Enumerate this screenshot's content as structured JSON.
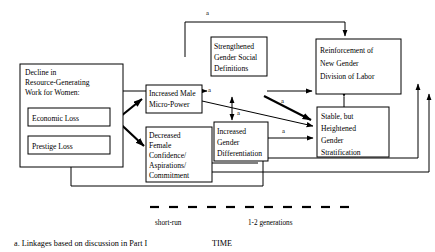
{
  "figure": {
    "type": "flow-diagram",
    "boxes": [
      {
        "id": "decline",
        "lines": [
          "Decline in",
          "Resource-Generating",
          "Work for Women:"
        ]
      },
      {
        "id": "economic-loss",
        "lines": [
          "Economic Loss"
        ]
      },
      {
        "id": "prestige-loss",
        "lines": [
          "Prestige Loss"
        ]
      },
      {
        "id": "increased-male-micro-power",
        "lines": [
          "Increased Male",
          "Micro-Power"
        ]
      },
      {
        "id": "decreased-female-confidence",
        "lines": [
          "Decreased",
          "Female",
          "Confidence/",
          "Aspirations/",
          "Commitment"
        ]
      },
      {
        "id": "strengthened-gender-social-definitions",
        "lines": [
          "Strengthened",
          "Gender Social",
          "Definitions"
        ]
      },
      {
        "id": "increased-gender-differentiation",
        "lines": [
          "Increased",
          "Gender",
          "Differentiation"
        ]
      },
      {
        "id": "reinforcement-new-gender-division-of-labor",
        "lines": [
          "Reinforcement of",
          "New Gender",
          "Division of Labor"
        ]
      },
      {
        "id": "stable-but-heightened-gender-stratification",
        "lines": [
          "Stable, but",
          "Heightened",
          "Gender",
          "Stratification"
        ]
      }
    ],
    "link_markers": {
      "top": "a",
      "male_power_right": "a",
      "definitions_down": "a",
      "differentiation_up": "a",
      "definitions_to_stable": "a",
      "differentiation_to_stable": "a"
    },
    "timeline": {
      "left_label": "short-run",
      "right_label": "1-2 generations",
      "axis_title": "TIME"
    },
    "footnote": "a. Linkages based on discussion in Part I"
  },
  "colors": {
    "stroke": "#000000",
    "background": "#ffffff"
  }
}
